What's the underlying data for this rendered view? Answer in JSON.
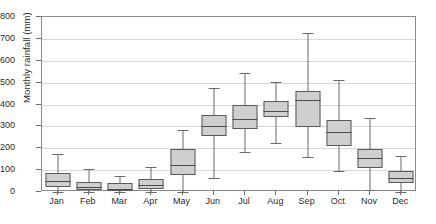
{
  "chart_data": {
    "type": "box",
    "title": "",
    "xlabel": "",
    "ylabel": "Monthly rainfall (mm)",
    "ylim": [
      0,
      800
    ],
    "ytick_values": [
      0,
      100,
      200,
      300,
      400,
      500,
      600,
      700,
      800
    ],
    "ytick_labels": [
      "0",
      "100",
      "200",
      "300",
      "400",
      "500",
      "600",
      "700",
      "800"
    ],
    "grid": true,
    "legend": "none",
    "categories": [
      "Jan",
      "Feb",
      "Mar",
      "Apr",
      "May",
      "Jun",
      "Jul",
      "Aug",
      "Sep",
      "Oct",
      "Nov",
      "Dec"
    ],
    "boxes": [
      {
        "category": "Jan",
        "min": 0,
        "q1": 25,
        "median": 50,
        "q3": 85,
        "max": 175
      },
      {
        "category": "Feb",
        "min": 0,
        "q1": 8,
        "median": 22,
        "q3": 45,
        "max": 105
      },
      {
        "category": "Mar",
        "min": 0,
        "q1": 5,
        "median": 15,
        "q3": 40,
        "max": 75
      },
      {
        "category": "Apr",
        "min": 0,
        "q1": 12,
        "median": 30,
        "q3": 60,
        "max": 115
      },
      {
        "category": "May",
        "min": 0,
        "q1": 80,
        "median": 125,
        "q3": 195,
        "max": 285
      },
      {
        "category": "Jun",
        "min": 65,
        "q1": 255,
        "median": 300,
        "q3": 350,
        "max": 475
      },
      {
        "category": "Jul",
        "min": 185,
        "q1": 290,
        "median": 335,
        "q3": 400,
        "max": 545
      },
      {
        "category": "Aug",
        "min": 225,
        "q1": 345,
        "median": 370,
        "q3": 415,
        "max": 505
      },
      {
        "category": "Sep",
        "min": 160,
        "q1": 295,
        "median": 420,
        "q3": 460,
        "max": 725
      },
      {
        "category": "Oct",
        "min": 95,
        "q1": 210,
        "median": 275,
        "q3": 330,
        "max": 510
      },
      {
        "category": "Nov",
        "min": 10,
        "q1": 110,
        "median": 155,
        "q3": 195,
        "max": 340
      },
      {
        "category": "Dec",
        "min": 0,
        "q1": 40,
        "median": 65,
        "q3": 95,
        "max": 165
      }
    ],
    "colors": {
      "box_fill": "#cfcfcf",
      "box_edge": "#5a5a5a",
      "whisker": "#6b6b6b",
      "median": "#4a4a4a",
      "grid": "#d8d8d8",
      "frame": "#8a8a8a",
      "text": "#2b2b2b",
      "background": "#ffffff"
    }
  }
}
